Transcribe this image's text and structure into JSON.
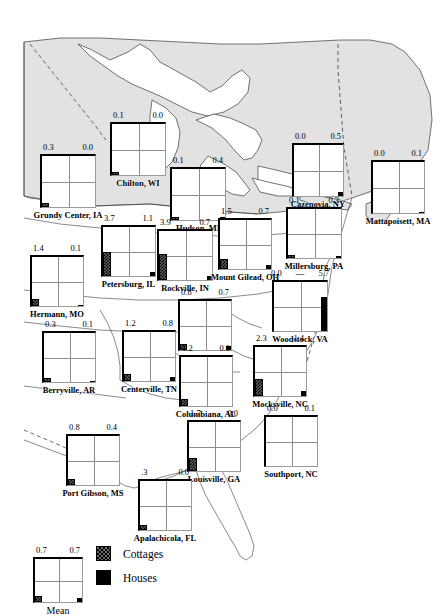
{
  "figure": {
    "type": "map-glyph-chart",
    "title": "",
    "legend": {
      "items": [
        {
          "id": "cottages",
          "label": "Cottages",
          "pattern": "hatched-checkered",
          "color": "#5a5a5a"
        },
        {
          "id": "houses",
          "label": "Houses",
          "pattern": "solid",
          "color": "#000000"
        }
      ]
    },
    "mean_glyph": {
      "label": "Mean",
      "cottages": "0.7",
      "houses": "0.7"
    }
  },
  "chart_data": {
    "type": "map",
    "title": "",
    "xlabel": "",
    "ylabel": "",
    "series": [
      {
        "name": "Cottages",
        "values": [
          0.1,
          0.3,
          0.1,
          0.0,
          0.0,
          3.7,
          3.9,
          1.5,
          0.1,
          1.4,
          0.0,
          0.8,
          0.3,
          1.2,
          1.2,
          2.3,
          0.8,
          1.7,
          0.0,
          0.3
        ]
      },
      {
        "name": "Houses",
        "values": [
          0.0,
          0.0,
          0.4,
          0.5,
          0.1,
          1.1,
          0.7,
          0.7,
          0.3,
          0.1,
          5.7,
          0.7,
          0.1,
          0.8,
          0.0,
          1.4,
          0.4,
          0.0,
          0.1,
          0.0
        ]
      }
    ],
    "categories": [
      "Chilton, WI",
      "Grundy Center, IA",
      "Hudson, MI",
      "Cazenovia, NY",
      "Mattapoisett, MA",
      "Petersburg, IL",
      "Rockville, IN",
      "Mount Gilead, OH",
      "Millersburg, PA",
      "Hermann, MO",
      "Woodstock, VA",
      "Stanford, KY",
      "Berryville, AR",
      "Centerville, TN",
      "Columbiana, AL",
      "Mocksville, NC",
      "Port Gibson, MS",
      "Louisville, GA",
      "Southport, NC",
      "Apalachicola, FL"
    ],
    "legend": [
      "Cottages",
      "Houses"
    ],
    "legend_position": "bottom-left",
    "grid": true
  },
  "sites": [
    {
      "id": "chilton-wi",
      "name": "Chilton, WI",
      "cottages": "0.1",
      "houses": "0.0",
      "x": 110,
      "y": 122,
      "w": 56,
      "h": 54,
      "c_bar": 1,
      "h_bar": 0
    },
    {
      "id": "grundy-center-ia",
      "name": "Grundy Center, IA",
      "cottages": "0.3",
      "houses": "0.0",
      "x": 40,
      "y": 154,
      "w": 56,
      "h": 54,
      "c_bar": 2,
      "h_bar": 0
    },
    {
      "id": "hudson-mi",
      "name": "Hudson, MI",
      "cottages": "0.1",
      "houses": "0.4",
      "x": 170,
      "y": 167,
      "w": 56,
      "h": 54,
      "c_bar": 1,
      "h_bar": 3
    },
    {
      "id": "cazenovia-ny",
      "name": "Cazenovia, NY",
      "cottages": "0.0",
      "houses": "0.5",
      "x": 292,
      "y": 143,
      "w": 52,
      "h": 54,
      "c_bar": 0,
      "h_bar": 4,
      "dashleft": true
    },
    {
      "id": "mattapoisett-ma",
      "name": "Mattapoisett, MA",
      "cottages": "0.0",
      "houses": "0.1",
      "x": 371,
      "y": 160,
      "w": 54,
      "h": 54,
      "c_bar": 0,
      "h_bar": 1
    },
    {
      "id": "petersburg-il",
      "name": "Petersburg, IL",
      "cottages": "3.7",
      "houses": "1.1",
      "x": 101,
      "y": 225,
      "w": 55,
      "h": 52,
      "c_bar": 22,
      "h_bar": 4
    },
    {
      "id": "rockville-in",
      "name": "Rockville, IN",
      "cottages": "3.9",
      "houses": "0.7",
      "x": 157,
      "y": 229,
      "w": 56,
      "h": 52,
      "c_bar": 24,
      "h_bar": 4
    },
    {
      "id": "mount-gilead-oh",
      "name": "Mount Gilead, OH",
      "cottages": "1.5",
      "houses": "0.7",
      "x": 218,
      "y": 218,
      "w": 54,
      "h": 52,
      "c_bar": 8,
      "h_bar": 4
    },
    {
      "id": "millersburg-pa",
      "name": "Millersburg, PA",
      "cottages": "0.1",
      "houses": "0.3",
      "x": 286,
      "y": 207,
      "w": 56,
      "h": 52,
      "c_bar": 1,
      "h_bar": 2
    },
    {
      "id": "hermann-mo",
      "name": "Hermann, MO",
      "cottages": "1.4",
      "houses": "0.1",
      "x": 30,
      "y": 255,
      "w": 54,
      "h": 52,
      "c_bar": 5,
      "h_bar": 1
    },
    {
      "id": "woodstock-va",
      "name": "Woodstock, VA",
      "cottages": "0.0",
      "houses": "5.7",
      "x": 272,
      "y": 280,
      "w": 56,
      "h": 52,
      "c_bar": 0,
      "h_bar": 34,
      "dashmid": true
    },
    {
      "id": "stanford-ky",
      "name": "Stanford, KY",
      "cottages": "0.8",
      "houses": "0.7",
      "x": 178,
      "y": 299,
      "w": 54,
      "h": 52,
      "c_bar": 4,
      "h_bar": 4
    },
    {
      "id": "berryville-ar",
      "name": "Berryville, AR",
      "cottages": "0.3",
      "houses": "0.1",
      "x": 42,
      "y": 331,
      "w": 54,
      "h": 52,
      "c_bar": 2,
      "h_bar": 1
    },
    {
      "id": "centerville-tn",
      "name": "Centerville, TN",
      "cottages": "1.2",
      "houses": "0.8",
      "x": 122,
      "y": 330,
      "w": 54,
      "h": 52,
      "c_bar": 5,
      "h_bar": 4
    },
    {
      "id": "columbiana-al",
      "name": "Columbiana, AL",
      "cottages": "1.2",
      "houses": "0.0",
      "x": 179,
      "y": 355,
      "w": 54,
      "h": 52,
      "c_bar": 5,
      "h_bar": 0
    },
    {
      "id": "mocksville-nc",
      "name": "Mocksville, NC",
      "cottages": "2.3",
      "houses": "1.4",
      "x": 253,
      "y": 345,
      "w": 54,
      "h": 52,
      "c_bar": 15,
      "h_bar": 5
    },
    {
      "id": "port-gibson-ms",
      "name": "Port Gibson, MS",
      "cottages": "0.8",
      "houses": "0.4",
      "x": 66,
      "y": 434,
      "w": 54,
      "h": 52,
      "c_bar": 4,
      "h_bar": 0
    },
    {
      "id": "louisville-ga",
      "name": "Louisville, GA",
      "cottages": "1.7",
      "houses": "0.0",
      "x": 187,
      "y": 420,
      "w": 54,
      "h": 52,
      "c_bar": 11,
      "h_bar": 0
    },
    {
      "id": "southport-nc",
      "name": "Southport, NC",
      "cottages": "0.0",
      "houses": "0.1",
      "x": 264,
      "y": 415,
      "w": 54,
      "h": 52,
      "c_bar": 0,
      "h_bar": 0
    },
    {
      "id": "apalachicola-fl",
      "name": "Apalachicola, FL",
      "cottages": ".3",
      "houses": "0.0",
      "x": 138,
      "y": 479,
      "w": 54,
      "h": 52,
      "c_bar": 3,
      "h_bar": 0
    }
  ]
}
